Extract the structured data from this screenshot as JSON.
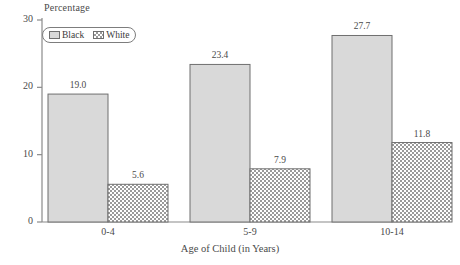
{
  "chart_data": {
    "type": "bar",
    "title": "",
    "subtitle": "",
    "xlabel": "Age of Child (in Years)",
    "ylabel": "Percentage",
    "categories": [
      "0-4",
      "5-9",
      "10-14"
    ],
    "series": [
      {
        "name": "Black",
        "values": [
          19.0,
          23.4,
          27.7
        ],
        "value_labels": [
          "19.0",
          "23.4",
          "27.7"
        ],
        "fill": "#d9d9d9",
        "pattern": "solid"
      },
      {
        "name": "White",
        "values": [
          5.6,
          7.9,
          11.8
        ],
        "value_labels": [
          "5.6",
          "7.9",
          "11.8"
        ],
        "fill": "#ffffff",
        "pattern": "checkerboard"
      }
    ],
    "ylim": [
      0,
      30
    ],
    "yticks": [
      0,
      10,
      20,
      30
    ],
    "ytick_labels": [
      "0",
      "10",
      "20",
      "30"
    ],
    "grid": false,
    "legend_position": "top-left",
    "axis_color": "#8a8a8a",
    "bar_border_color": "#6f6f6f",
    "text_color": "#4a4a4a"
  },
  "legend": {
    "entries": [
      {
        "label": "Black"
      },
      {
        "label": "White"
      }
    ]
  },
  "axes": {
    "y_title": "Percentage",
    "x_title": "Age of Child (in Years)"
  }
}
